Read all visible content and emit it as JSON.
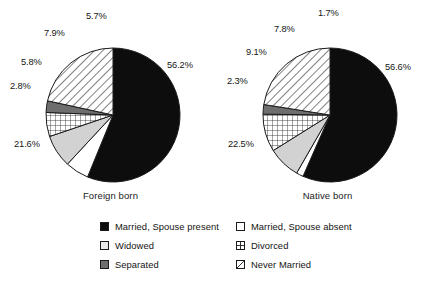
{
  "chart_data": {
    "type": "pie",
    "title": "",
    "legend_position": "bottom",
    "legend": {
      "columns": [
        [
          {
            "label": "Married, Spouse present",
            "key": "married_spouse_present",
            "pattern": "solid-black",
            "swatch_name": "legend-swatch-married-spouse-present"
          },
          {
            "label": "Widowed",
            "key": "widowed",
            "pattern": "light-gray",
            "swatch_name": "legend-swatch-widowed"
          },
          {
            "label": "Separated",
            "key": "separated",
            "pattern": "dark-gray",
            "swatch_name": "legend-swatch-separated"
          }
        ],
        [
          {
            "label": "Married, Spouse absent",
            "key": "married_spouse_absent",
            "pattern": "white",
            "swatch_name": "legend-swatch-married-spouse-absent"
          },
          {
            "label": "Divorced",
            "key": "divorced",
            "pattern": "grid",
            "swatch_name": "legend-swatch-divorced"
          },
          {
            "label": "Never Married",
            "key": "never_married",
            "pattern": "diagonal",
            "swatch_name": "legend-swatch-never-married"
          }
        ]
      ]
    },
    "categories": [
      "Married, Spouse present",
      "Married, Spouse absent",
      "Widowed",
      "Divorced",
      "Separated",
      "Never Married"
    ],
    "series": [
      {
        "name": "Foreign born",
        "caption": "Foreign born",
        "values": [
          56.2,
          5.7,
          7.9,
          5.8,
          2.8,
          21.6
        ],
        "labels": [
          "56.2%",
          "5.7%",
          "7.9%",
          "5.8%",
          "2.8%",
          "21.6%"
        ]
      },
      {
        "name": "Native born",
        "caption": "Native born",
        "values": [
          56.6,
          1.7,
          7.8,
          9.1,
          2.3,
          22.5
        ],
        "labels": [
          "56.6%",
          "1.7%",
          "7.8%",
          "9.1%",
          "2.3%",
          "22.5%"
        ]
      }
    ],
    "units": "percent",
    "start_angle_deg": 0,
    "direction": "clockwise"
  },
  "charts": {
    "foreign": {
      "caption": "Foreign born",
      "labels": {
        "married_spouse_present": "56.2%",
        "married_spouse_absent": "5.7%",
        "widowed": "7.9%",
        "divorced": "5.8%",
        "separated": "2.8%",
        "never_married": "21.6%"
      }
    },
    "native": {
      "caption": "Native born",
      "labels": {
        "married_spouse_present": "56.6%",
        "married_spouse_absent": "1.7%",
        "widowed": "7.8%",
        "divorced": "9.1%",
        "separated": "2.3%",
        "never_married": "22.5%"
      }
    }
  },
  "colors": {
    "outline": "#1a1a1a",
    "solid_black": "#0d0d0d",
    "light_gray": "#d2d2d2",
    "dark_gray": "#6e6e6e",
    "white": "#ffffff",
    "background": "#ffffff",
    "text": "#161616"
  }
}
